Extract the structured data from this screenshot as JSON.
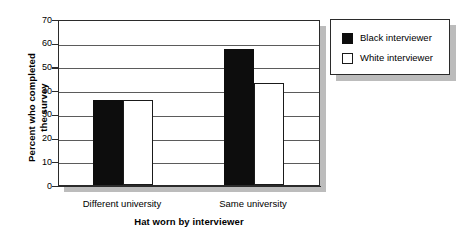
{
  "chart_data": {
    "type": "bar",
    "title": "",
    "subtitle": "",
    "xlabel": "Hat worn by interviewer",
    "ylabel_line1": "Percent who completed",
    "ylabel_line2": "the survey",
    "ylabel": "Percent who completed the survey",
    "categories": [
      "Different university",
      "Same university"
    ],
    "series": [
      {
        "name": "Black interviewer",
        "color": "#0d0d0d",
        "values": [
          36,
          57.5
        ]
      },
      {
        "name": "White interviewer",
        "color": "#ffffff",
        "values": [
          36,
          43
        ]
      }
    ],
    "ylim": [
      0,
      70
    ],
    "yticks": [
      0,
      10,
      20,
      30,
      40,
      50,
      60,
      70
    ],
    "ytick_labels": [
      "0",
      "10",
      "20",
      "30",
      "40",
      "50",
      "60",
      "70"
    ],
    "grid": "horizontal",
    "legend_position": "right-outside"
  },
  "legend": {
    "items": [
      {
        "label": "Black interviewer",
        "swatch": "black-square-icon"
      },
      {
        "label": "White interviewer",
        "swatch": "white-square-icon"
      }
    ]
  }
}
